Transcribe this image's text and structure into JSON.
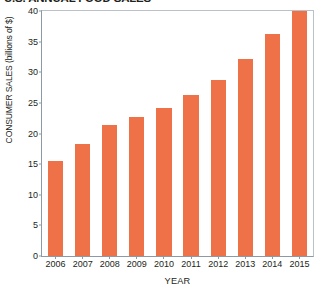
{
  "chart_data": {
    "type": "bar",
    "title": "U.S. ANNUAL FOOD SALES",
    "xlabel": "YEAR",
    "ylabel": "CONSUMER SALES (billions of $)",
    "categories": [
      "2006",
      "2007",
      "2008",
      "2009",
      "2010",
      "2011",
      "2012",
      "2013",
      "2014",
      "2015"
    ],
    "values": [
      15.5,
      18.3,
      21.4,
      22.7,
      24.1,
      26.3,
      28.8,
      32.1,
      36.2,
      40.0
    ],
    "series": [
      {
        "name": "Consumer sales",
        "values": [
          15.5,
          18.3,
          21.4,
          22.7,
          24.1,
          26.3,
          28.8,
          32.1,
          36.2,
          40.0
        ]
      }
    ],
    "ylim": [
      0,
      40
    ],
    "ytick_labels": [
      "0",
      "5",
      "10",
      "15",
      "20",
      "25",
      "30",
      "35",
      "40"
    ],
    "ytick_values": [
      0,
      5,
      10,
      15,
      20,
      25,
      30,
      35,
      40
    ],
    "grid": false,
    "legend": "none",
    "bar_color": "#ee7148",
    "axis_color": "#8c99a6",
    "text_color": "#231f20"
  }
}
